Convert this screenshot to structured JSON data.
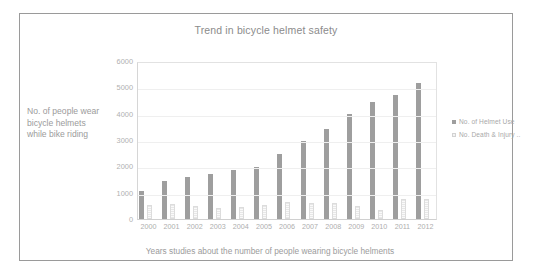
{
  "chart_data": {
    "type": "bar",
    "title": "Trend in bicycle helmet safety",
    "xlabel": "Years studies about the number of people wearing bicycle helments",
    "ylabel": "No. of people wear bicycle helmets while bike riding",
    "categories": [
      "2000",
      "2001",
      "2002",
      "2003",
      "2004",
      "2005",
      "2006",
      "2007",
      "2008",
      "2009",
      "2010",
      "2011",
      "2012"
    ],
    "series": [
      {
        "name": "No. of Helmet Use",
        "color": "#9e9e9e",
        "values": [
          1050,
          1430,
          1600,
          1720,
          1850,
          1960,
          2470,
          2950,
          3430,
          3970,
          4450,
          4700,
          5150
        ]
      },
      {
        "name": "No. Death & Injury",
        "color": "#e7e7e7",
        "values": [
          540,
          560,
          480,
          410,
          460,
          530,
          660,
          600,
          590,
          510,
          350,
          770,
          760
        ]
      }
    ],
    "ylim": [
      0,
      6000
    ],
    "ytick_labels": [
      "6000",
      "5000",
      "4000",
      "3000",
      "2000",
      "1000",
      "0"
    ],
    "ytick_values": [
      6000,
      5000,
      4000,
      3000,
      2000,
      1000,
      0
    ],
    "grid": true,
    "legend_position": "right"
  },
  "legend": {
    "entries": [
      {
        "label": "No. of Helmet Use"
      },
      {
        "label": "No. Death & Injury .."
      }
    ]
  },
  "colors": {
    "series_primary": "#9e9e9e",
    "series_secondary": "#e7e7e7",
    "text_muted": "#9b9b9b",
    "gridline": "#efefef",
    "frame_border": "#9a9a9a"
  }
}
